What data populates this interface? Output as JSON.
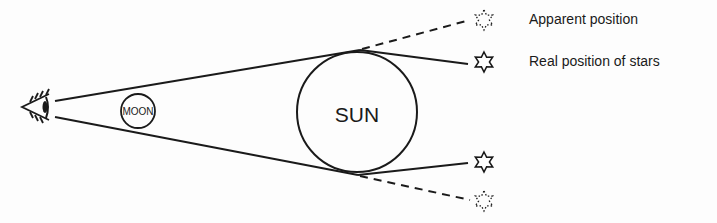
{
  "diagram": {
    "type": "gravitational-lensing-eclipse",
    "bodies": {
      "moon": {
        "label": "MOON"
      },
      "sun": {
        "label": "SUN"
      }
    },
    "legend": {
      "apparent": "Apparent position",
      "real": "Real position of stars"
    },
    "colors": {
      "stroke": "#1a1a1a",
      "background": "#fdfdfd"
    }
  }
}
